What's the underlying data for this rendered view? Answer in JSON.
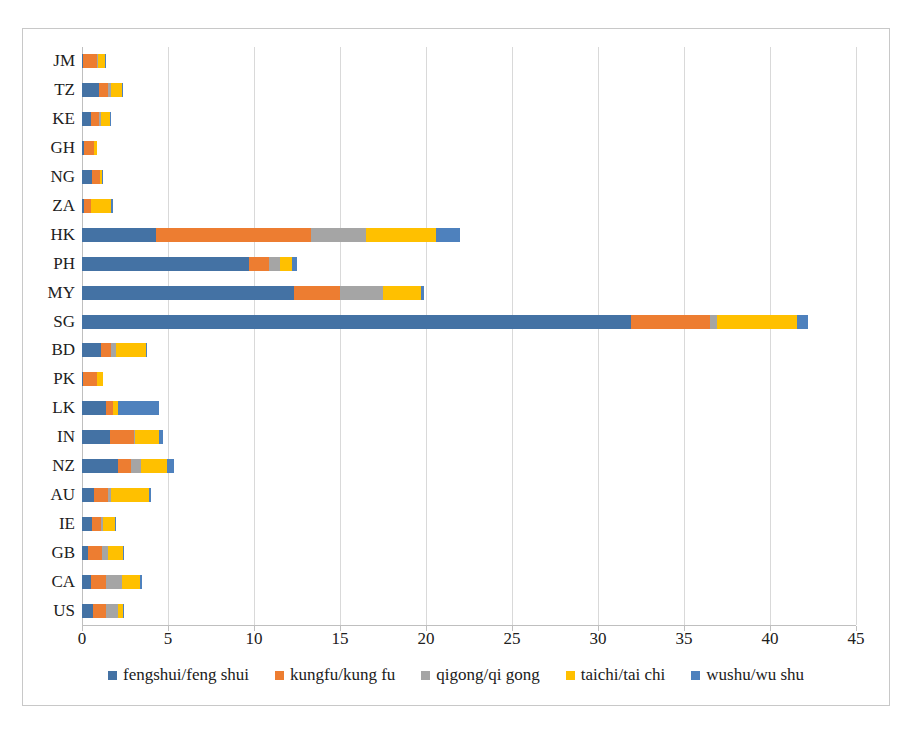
{
  "chart_data": {
    "type": "bar",
    "orientation": "horizontal",
    "stacked": true,
    "title": "",
    "xlabel": "",
    "ylabel": "",
    "xlim": [
      0,
      45
    ],
    "xticks": [
      0,
      5,
      10,
      15,
      20,
      25,
      30,
      35,
      40,
      45
    ],
    "grid": true,
    "legend_position": "bottom",
    "categories": [
      "JM",
      "TZ",
      "KE",
      "GH",
      "NG",
      "ZA",
      "HK",
      "PH",
      "MY",
      "SG",
      "BD",
      "PK",
      "LK",
      "IN",
      "NZ",
      "AU",
      "IE",
      "GB",
      "CA",
      "US"
    ],
    "series": [
      {
        "name": "fengshui/feng shui",
        "color": "#4472A4",
        "values": [
          0.05,
          1.0,
          0.5,
          0.1,
          0.6,
          0.1,
          4.3,
          9.7,
          12.3,
          31.9,
          1.1,
          0.05,
          1.4,
          1.6,
          2.1,
          0.7,
          0.6,
          0.35,
          0.5,
          0.65
        ]
      },
      {
        "name": "kungfu/kung fu",
        "color": "#ED7D31",
        "values": [
          0.8,
          0.5,
          0.5,
          0.6,
          0.45,
          0.4,
          9.0,
          1.2,
          2.7,
          4.6,
          0.6,
          0.8,
          0.4,
          1.4,
          0.75,
          0.8,
          0.5,
          0.8,
          0.9,
          0.75
        ]
      },
      {
        "name": "qigong/qi gong",
        "color": "#A5A5A5",
        "values": [
          0.1,
          0.2,
          0.1,
          0.0,
          0.0,
          0.0,
          3.2,
          0.6,
          2.5,
          0.4,
          0.3,
          0.0,
          0.0,
          0.1,
          0.6,
          0.2,
          0.1,
          0.35,
          0.9,
          0.7
        ]
      },
      {
        "name": "taichi/tai chi",
        "color": "#FFC000",
        "values": [
          0.4,
          0.6,
          0.5,
          0.2,
          0.1,
          1.2,
          4.1,
          0.7,
          2.2,
          4.7,
          1.7,
          0.4,
          0.3,
          1.4,
          1.5,
          2.2,
          0.7,
          0.9,
          1.1,
          0.3
        ]
      },
      {
        "name": "wushu/wu shu",
        "color": "#4E81BD"
      }
    ],
    "series_wushu_values": [
      0.05,
      0.1,
      0.1,
      0.0,
      0.05,
      0.1,
      1.4,
      0.3,
      0.2,
      0.6,
      0.1,
      0.0,
      2.4,
      0.2,
      0.4,
      0.1,
      0.1,
      0.05,
      0.1,
      0.05
    ],
    "totals": [
      1.4,
      2.4,
      1.7,
      0.9,
      1.2,
      1.8,
      22.0,
      12.5,
      19.9,
      42.2,
      3.8,
      1.25,
      4.5,
      4.7,
      5.35,
      4.0,
      2.0,
      2.45,
      3.5,
      2.45
    ]
  }
}
